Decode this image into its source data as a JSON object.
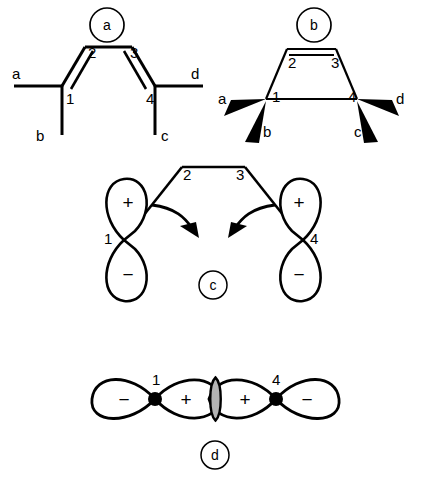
{
  "figure": {
    "stroke_color": "#000000",
    "background_color": "#ffffff",
    "overlap_fill": "#b4b4b4"
  },
  "panels": [
    {
      "id": "a",
      "label": "a",
      "kind": "skeletal-structure",
      "description": "s-cis butadiene drawn as open chain with two double bonds",
      "carbon_numbers": [
        "1",
        "2",
        "3",
        "4"
      ],
      "substituents": [
        "a",
        "b",
        "c",
        "d"
      ]
    },
    {
      "id": "b",
      "label": "b",
      "kind": "skeletal-structure",
      "description": "butadiene drawn as trapezoid with stereochemical wedge bonds",
      "carbon_numbers": [
        "1",
        "2",
        "3",
        "4"
      ],
      "substituents": [
        "a",
        "b",
        "c",
        "d"
      ]
    },
    {
      "id": "c",
      "label": "c",
      "kind": "orbital-diagram",
      "description": "terminal p orbitals on C1 and C4 with rotation arrows",
      "carbon_numbers": [
        "1",
        "2",
        "3",
        "4"
      ],
      "orbital_signs": [
        "+",
        "−",
        "+",
        "−"
      ],
      "arrows": 2
    },
    {
      "id": "d",
      "label": "d",
      "kind": "orbital-overlap",
      "description": "resulting sigma bond from in-phase overlap of C1 and C4 lobes",
      "carbon_numbers": [
        "1",
        "4"
      ],
      "orbital_signs": [
        "−",
        "+",
        "+",
        "−"
      ],
      "overlap_shaded": true
    }
  ],
  "panel_a": {
    "circle_label": "a",
    "atom_labels": [
      {
        "text": "1",
        "x": 66,
        "y": 104
      },
      {
        "text": "2",
        "x": 88,
        "y": 58
      },
      {
        "text": "3",
        "x": 130,
        "y": 58
      },
      {
        "text": "4",
        "x": 146,
        "y": 104
      }
    ],
    "substituent_labels": [
      {
        "text": "a",
        "x": 12,
        "y": 99
      },
      {
        "text": "b",
        "x": 36,
        "y": 138
      },
      {
        "text": "c",
        "x": 171,
        "y": 138
      },
      {
        "text": "d",
        "x": 191,
        "y": 99
      }
    ]
  },
  "panel_b": {
    "circle_label": "b",
    "atom_labels": [
      {
        "text": "1",
        "x": 272,
        "y": 102
      },
      {
        "text": "2",
        "x": 290,
        "y": 62
      },
      {
        "text": "3",
        "x": 336,
        "y": 62
      },
      {
        "text": "4",
        "x": 355,
        "y": 102
      }
    ],
    "substituent_labels": [
      {
        "text": "a",
        "x": 224,
        "y": 104
      },
      {
        "text": "b",
        "x": 262,
        "y": 137
      },
      {
        "text": "c",
        "x": 358,
        "y": 137
      },
      {
        "text": "d",
        "x": 399,
        "y": 104
      }
    ]
  },
  "panel_c": {
    "circle_label": "c",
    "atom_labels": [
      {
        "text": "1",
        "x": 110,
        "y": 237
      },
      {
        "text": "2",
        "x": 185,
        "y": 175
      },
      {
        "text": "3",
        "x": 240,
        "y": 175
      },
      {
        "text": "4",
        "x": 316,
        "y": 237
      }
    ],
    "sign_labels": [
      {
        "text": "+",
        "x": 128,
        "y": 203
      },
      {
        "text": "−",
        "x": 128,
        "y": 275
      },
      {
        "text": "+",
        "x": 309,
        "y": 203
      },
      {
        "text": "−",
        "x": 309,
        "y": 275
      }
    ]
  },
  "panel_d": {
    "circle_label": "d",
    "atom_labels": [
      {
        "text": "1",
        "x": 161,
        "y": 382
      },
      {
        "text": "4",
        "x": 271,
        "y": 382
      }
    ],
    "sign_labels": [
      {
        "text": "−",
        "x": 128,
        "y": 404
      },
      {
        "text": "+",
        "x": 186,
        "y": 404
      },
      {
        "text": "+",
        "x": 243,
        "y": 404
      },
      {
        "text": "−",
        "x": 303,
        "y": 404
      }
    ]
  }
}
